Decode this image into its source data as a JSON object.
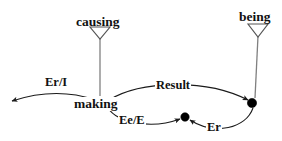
{
  "diagram": {
    "type": "conceptual-graph",
    "background_color": "#ffffff",
    "line_color": "#1a1a1a",
    "stem_color": "#808080",
    "nodes": [
      {
        "id": "causing",
        "label": "causing",
        "marker": "hollow-down-triangle",
        "x": 100,
        "y": 22
      },
      {
        "id": "being",
        "label": "being",
        "marker": "hollow-down-triangle",
        "x": 258,
        "y": 18
      },
      {
        "id": "making",
        "label": "making",
        "marker": "text",
        "x": 100,
        "y": 103
      },
      {
        "id": "result-node",
        "label": "",
        "marker": "filled-dot",
        "x": 252,
        "y": 103
      },
      {
        "id": "mid-node",
        "label": "",
        "marker": "filled-dot",
        "x": 185,
        "y": 117
      },
      {
        "id": "open-end",
        "label": "",
        "marker": "arrowhead",
        "x": 8,
        "y": 101
      }
    ],
    "edges": [
      {
        "id": "er-i",
        "label": "Er/I",
        "from": "making",
        "to": "open-end"
      },
      {
        "id": "result",
        "label": "Result",
        "from": "making",
        "to": "result-node"
      },
      {
        "id": "ee-e",
        "label": "Ee/E",
        "from": "making",
        "to": "mid-node"
      },
      {
        "id": "er",
        "label": "Er",
        "from": "result-node",
        "to": "mid-node"
      }
    ]
  }
}
